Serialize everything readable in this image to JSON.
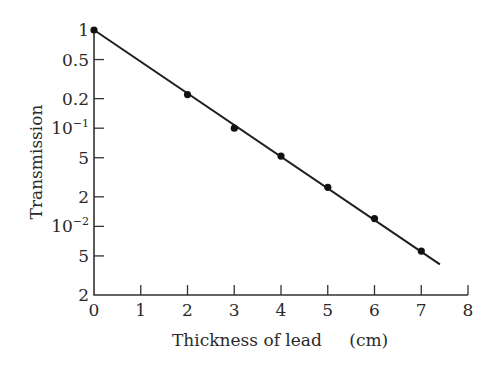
{
  "chart_data": {
    "type": "scatter",
    "title": "",
    "xlabel": "Thickness of lead",
    "xlabel_unit": "(cm)",
    "ylabel": "Transmission",
    "xscale": "linear",
    "yscale": "log",
    "xlim": [
      0,
      8
    ],
    "ylim": [
      0.002,
      1
    ],
    "grid": false,
    "legend": null,
    "x_ticks": [
      0,
      1,
      2,
      3,
      4,
      5,
      6,
      7,
      8
    ],
    "x_tick_labels": [
      "0",
      "1",
      "2",
      "3",
      "4",
      "5",
      "6",
      "7",
      "8"
    ],
    "y_ticks": [
      1,
      0.5,
      0.2,
      0.1,
      0.05,
      0.02,
      0.01,
      0.005,
      0.002
    ],
    "y_tick_labels": [
      {
        "base": "1",
        "sup": ""
      },
      {
        "base": "0.5",
        "sup": ""
      },
      {
        "base": "0.2",
        "sup": ""
      },
      {
        "base": "10",
        "sup": "−1"
      },
      {
        "base": "5",
        "sup": ""
      },
      {
        "base": "2",
        "sup": ""
      },
      {
        "base": "10",
        "sup": "−2"
      },
      {
        "base": "5",
        "sup": ""
      },
      {
        "base": "2",
        "sup": ""
      }
    ],
    "series": [
      {
        "name": "Measured transmission",
        "type": "scatter",
        "x": [
          0,
          2,
          3,
          4,
          5,
          6,
          7
        ],
        "y": [
          1.0,
          0.22,
          0.1,
          0.052,
          0.025,
          0.012,
          0.0056
        ]
      },
      {
        "name": "Exponential fit",
        "type": "line",
        "x": [
          0,
          7.4
        ],
        "y": [
          1.0,
          0.0041
        ]
      }
    ]
  },
  "axes": {
    "x_title": "Thickness of lead",
    "x_unit": "(cm)",
    "y_title": "Transmission"
  }
}
